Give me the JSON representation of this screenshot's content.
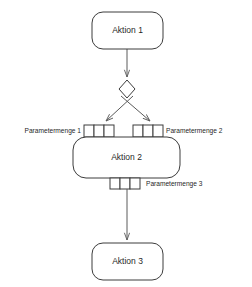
{
  "diagram": {
    "background_color": "#ffffff",
    "stroke_color": "#3c3c3c",
    "connector_color": "#5a5a5a",
    "text_color": "#1f1f1f",
    "nodes": [
      {
        "id": "aktion-1",
        "label": "Aktion 1",
        "shape": "rounded-rectangle",
        "x": 92,
        "y": 12,
        "width": 71,
        "height": 37
      },
      {
        "id": "decision",
        "label": "",
        "shape": "diamond",
        "cx": 127,
        "cy": 89,
        "half_width": 8,
        "half_height": 9
      },
      {
        "id": "aktion-2",
        "label": "Aktion 2",
        "shape": "rounded-rectangle",
        "x": 73,
        "y": 137,
        "width": 107,
        "height": 41
      },
      {
        "id": "aktion-3",
        "label": "Aktion 3",
        "shape": "rounded-rectangle",
        "x": 92,
        "y": 243,
        "width": 71,
        "height": 37
      }
    ],
    "parameter_sets": [
      {
        "id": "parametermenge-1",
        "label": "Parametermenge 1",
        "label_position": "left",
        "label_x": 81,
        "label_y": 131,
        "cells": 3,
        "x": 84,
        "y": 125,
        "cell_width": 10,
        "cell_height": 12
      },
      {
        "id": "parametermenge-2",
        "label": "Parametermenge 2",
        "label_position": "right",
        "label_x": 166,
        "label_y": 131,
        "cells": 3,
        "x": 133,
        "y": 125,
        "cell_width": 10,
        "cell_height": 12
      },
      {
        "id": "parametermenge-3",
        "label": "Parametermenge 3",
        "label_position": "right",
        "label_x": 146,
        "label_y": 184,
        "cells": 3,
        "x": 110,
        "y": 178,
        "cell_width": 10,
        "cell_height": 11
      }
    ],
    "connectors": [
      {
        "id": "aktion1-to-decision",
        "from": "aktion-1",
        "to": "decision",
        "type": "arrow",
        "path": "M127,49 L127,78"
      },
      {
        "id": "decision-to-parametermenge-1",
        "from": "decision",
        "to": "parametermenge-1",
        "type": "arrow",
        "path": "M133,96 L105,122"
      },
      {
        "id": "decision-to-parametermenge-2",
        "from": "decision",
        "to": "parametermenge-2",
        "type": "arrow",
        "path": "M121,96 L151,122"
      },
      {
        "id": "parametermenge3-to-aktion3",
        "from": "parametermenge-3",
        "to": "aktion-3",
        "type": "arrow",
        "path": "M127,189 L127,240"
      }
    ]
  }
}
